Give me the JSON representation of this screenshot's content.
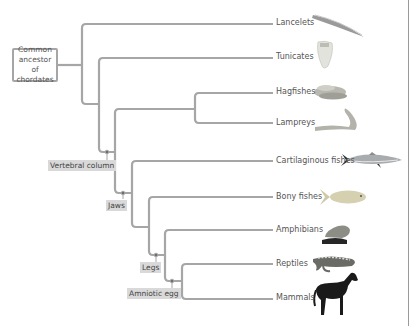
{
  "diagram": {
    "type": "phylogenetic-tree",
    "root_label": "Common ancestor of chordates",
    "root_lines": [
      "Common",
      "ancestor of",
      "chordates"
    ],
    "line_color": "#a6a6a6",
    "node_label_bg": "#d9d9d9",
    "leaves": [
      {
        "label": "Lancelets",
        "icon": "lancelet-icon",
        "y": 22
      },
      {
        "label": "Tunicates",
        "icon": "tunicate-icon",
        "y": 57
      },
      {
        "label": "Hagfishes",
        "icon": "hagfish-icon",
        "y": 92
      },
      {
        "label": "Lampreys",
        "icon": "lamprey-icon",
        "y": 124
      },
      {
        "label": "Cartilaginous fishes",
        "icon": "shark-icon",
        "y": 161
      },
      {
        "label": "Bony fishes",
        "icon": "bony-fish-icon",
        "y": 197
      },
      {
        "label": "Amphibians",
        "icon": "frog-icon",
        "y": 230
      },
      {
        "label": "Reptiles",
        "icon": "lizard-icon",
        "y": 264
      },
      {
        "label": "Mammals",
        "icon": "horse-icon",
        "y": 298
      }
    ],
    "derived_characters": [
      {
        "label": "Vertebral column"
      },
      {
        "label": "Jaws"
      },
      {
        "label": "Legs"
      },
      {
        "label": "Amniotic egg"
      }
    ]
  }
}
